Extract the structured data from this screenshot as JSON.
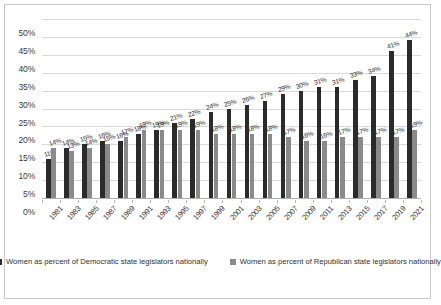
{
  "chart_data": {
    "type": "bar",
    "title": "",
    "xlabel": "",
    "ylabel": "",
    "ylim": [
      0,
      50
    ],
    "ytick_labels": [
      "0%",
      "5%",
      "10%",
      "15%",
      "20%",
      "25%",
      "30%",
      "35%",
      "40%",
      "45%",
      "50%"
    ],
    "ytick_values": [
      0,
      5,
      10,
      15,
      20,
      25,
      30,
      35,
      40,
      45,
      50
    ],
    "grid": true,
    "legend_position": "bottom",
    "value_suffix": "%",
    "categories": [
      "1981",
      "1983",
      "1985",
      "1987",
      "1989",
      "1991",
      "1993",
      "1995",
      "1997",
      "1999",
      "2001",
      "2003",
      "2005",
      "2007",
      "2009",
      "2011",
      "2013",
      "2015",
      "2017",
      "2019",
      "2021"
    ],
    "series": [
      {
        "name": "Women as percent of Democratic state legislators nationally",
        "color": "#2b2b2b",
        "values": [
          11,
          14,
          15,
          16,
          16,
          18,
          19,
          21,
          22,
          24,
          25,
          26,
          27,
          29,
          30,
          31,
          31,
          33,
          34,
          41,
          44
        ],
        "labels": [
          "11%",
          "14%",
          "15%",
          "16%",
          "16%",
          "18%",
          "19%",
          "21%",
          "22%",
          "24%",
          "25%",
          "26%",
          "27%",
          "29%",
          "30%",
          "31%",
          "31%",
          "33%",
          "34%",
          "41%",
          "44%"
        ]
      },
      {
        "name": "Women as percent of Republican state legislators nationally",
        "color": "#8a8a8a",
        "values": [
          14,
          13,
          14,
          15,
          17,
          19,
          19,
          19,
          19,
          18,
          18,
          18,
          18,
          17,
          16,
          16,
          17,
          17,
          17,
          17,
          19
        ],
        "labels": [
          "14%",
          "13%",
          "14%",
          "15%",
          "17%",
          "19%",
          "19%",
          "19%",
          "19%",
          "18%",
          "18%",
          "18%",
          "18%",
          "17%",
          "16%",
          "16%",
          "17%",
          "17%",
          "17%",
          "17%",
          "19%"
        ]
      }
    ]
  },
  "legend": {
    "items": [
      {
        "label": "Women as percent of Democratic state legislators nationally"
      },
      {
        "label": "Women as percent of Republican state legislators nationally"
      }
    ]
  }
}
